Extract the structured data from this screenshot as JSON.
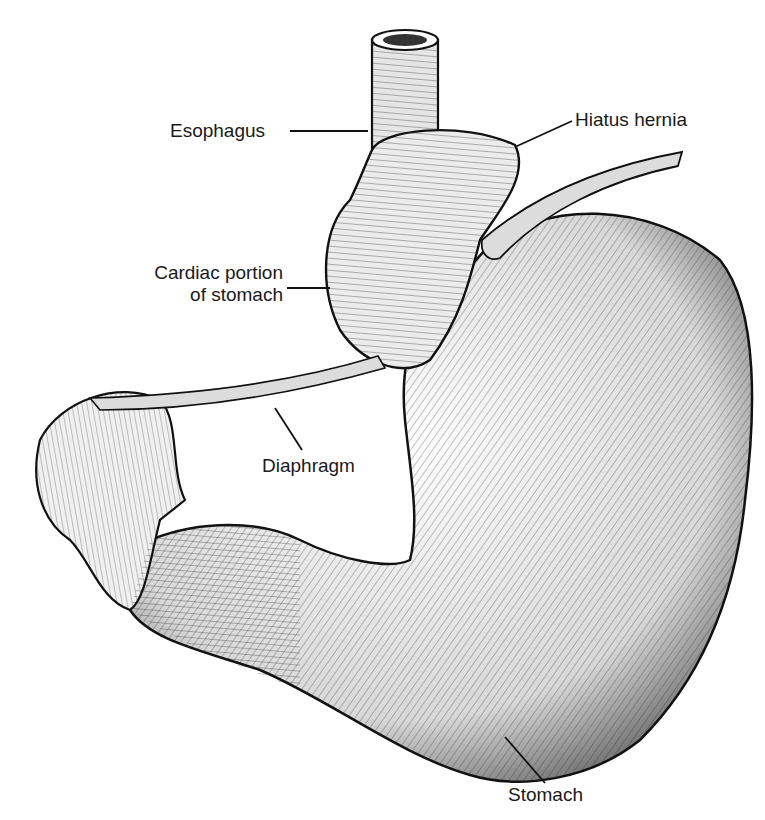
{
  "figure": {
    "background": "#ffffff",
    "ink": "#1a1a1a"
  },
  "labels": {
    "esophagus": "Esophagus",
    "hiatus_hernia": "Hiatus hernia",
    "cardiac_line1": "Cardiac portion",
    "cardiac_line2": "of stomach",
    "diaphragm": "Diaphragm",
    "stomach": "Stomach"
  }
}
